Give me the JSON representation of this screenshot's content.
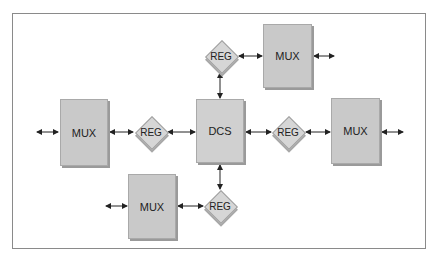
{
  "diagram": {
    "nodes": [
      {
        "id": "mux_top",
        "type": "MUX",
        "label": "MUX"
      },
      {
        "id": "reg_top",
        "type": "REG",
        "label": "REG"
      },
      {
        "id": "mux_left",
        "type": "MUX",
        "label": "MUX"
      },
      {
        "id": "reg_left",
        "type": "REG",
        "label": "REG"
      },
      {
        "id": "dcs",
        "type": "DCS",
        "label": "DCS"
      },
      {
        "id": "reg_right",
        "type": "REG",
        "label": "REG"
      },
      {
        "id": "mux_right",
        "type": "MUX",
        "label": "MUX"
      },
      {
        "id": "mux_bottom",
        "type": "MUX",
        "label": "MUX"
      },
      {
        "id": "reg_bottom",
        "type": "REG",
        "label": "REG"
      }
    ],
    "edges": [
      {
        "from": "reg_top",
        "to": "dcs",
        "bidirectional": true
      },
      {
        "from": "reg_top",
        "to": "mux_top",
        "bidirectional": true
      },
      {
        "from": "mux_top",
        "to": "external",
        "bidirectional": true
      },
      {
        "from": "external",
        "to": "mux_left",
        "bidirectional": true
      },
      {
        "from": "mux_left",
        "to": "reg_left",
        "bidirectional": true
      },
      {
        "from": "reg_left",
        "to": "dcs",
        "bidirectional": true
      },
      {
        "from": "dcs",
        "to": "reg_right",
        "bidirectional": true
      },
      {
        "from": "reg_right",
        "to": "mux_right",
        "bidirectional": true
      },
      {
        "from": "mux_right",
        "to": "external",
        "bidirectional": true
      },
      {
        "from": "dcs",
        "to": "reg_bottom",
        "bidirectional": true
      },
      {
        "from": "reg_bottom",
        "to": "mux_bottom",
        "bidirectional": true
      },
      {
        "from": "external",
        "to": "mux_bottom",
        "bidirectional": true
      }
    ],
    "colors": {
      "box_fill": "#c9c9c9",
      "diamond_fill": "#d6d6d6",
      "line": "#222222",
      "frame": "#8a8a8a"
    }
  }
}
